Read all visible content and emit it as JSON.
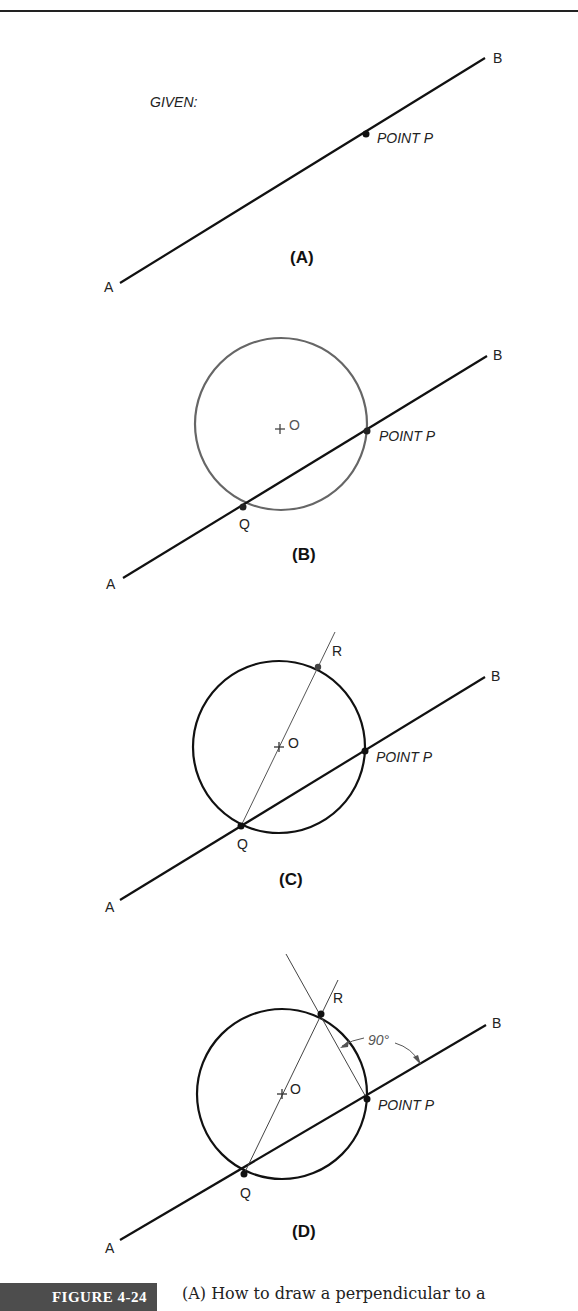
{
  "page": {
    "header_clipped": "Section 4"
  },
  "figure": {
    "number_label": "FIGURE 4-24",
    "caption": "(A) How to draw a perpendicular to a",
    "panels": [
      {
        "id": "A",
        "label": "(A)",
        "given_label": "GIVEN:",
        "point_p_label": "POINT P",
        "end_a": "A",
        "end_b": "B"
      },
      {
        "id": "B",
        "label": "(B)",
        "center_label": "O",
        "point_p_label": "POINT P",
        "point_q_label": "Q",
        "end_a": "A",
        "end_b": "B"
      },
      {
        "id": "C",
        "label": "(C)",
        "center_label": "O",
        "point_p_label": "POINT P",
        "point_q_label": "Q",
        "point_r_label": "R",
        "end_a": "A",
        "end_b": "B"
      },
      {
        "id": "D",
        "label": "(D)",
        "center_label": "O",
        "point_p_label": "POINT P",
        "point_q_label": "Q",
        "point_r_label": "R",
        "angle_label": "90°",
        "end_a": "A",
        "end_b": "B"
      }
    ]
  },
  "colors": {
    "line": "#111111",
    "construction": "#555555",
    "circle_b": "#666666",
    "tag_bg": "#4d4d4d"
  }
}
